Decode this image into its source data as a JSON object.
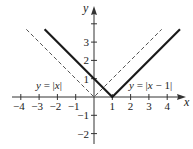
{
  "chart_data": {
    "type": "line",
    "title": "",
    "xlabel": "x",
    "ylabel": "y",
    "xlim": [
      -4.3,
      4.9
    ],
    "ylim": [
      -2.5,
      4.9
    ],
    "grid": false,
    "x_ticks": [
      -4,
      -3,
      -2,
      -1,
      1,
      2,
      3,
      4
    ],
    "x_tick_labels": [
      "−4",
      "−3",
      "−2",
      "−1",
      "1",
      "2",
      "3",
      "4"
    ],
    "y_ticks": [
      4,
      3,
      2,
      1,
      -1,
      -2
    ],
    "y_tick_labels": [
      "",
      "3",
      "2",
      "1",
      "−1",
      "−2"
    ],
    "series": [
      {
        "name": "y = |x|",
        "style": "dashed",
        "color": "#555555",
        "x": [
          -3.7,
          0,
          3.7
        ],
        "y": [
          3.7,
          0,
          3.7
        ]
      },
      {
        "name": "y = |x − 1|",
        "style": "solid-thick",
        "color": "#1a1a1a",
        "x": [
          -2.7,
          1,
          4.7
        ],
        "y": [
          3.7,
          0,
          3.7
        ]
      }
    ],
    "annotations": [
      {
        "text_var": "y",
        "text_rest": " = |",
        "text_var2": "x",
        "text_end": "|",
        "x": -3.2,
        "y": 0.6
      },
      {
        "text_var": "y",
        "text_rest": " = |",
        "text_var2": "x",
        "text_end": " − 1|",
        "x": 1.95,
        "y": 0.6
      }
    ]
  },
  "labels": {
    "x_axis": "x",
    "y_axis": "y",
    "curve1": {
      "a": "y",
      "b": " = |",
      "c": "x",
      "d": "|"
    },
    "curve2": {
      "a": "y",
      "b": " = |",
      "c": "x",
      "d": " − 1|"
    }
  },
  "colors": {
    "axis": "#333333",
    "dashed": "#555555",
    "solid": "#1a1a1a"
  }
}
